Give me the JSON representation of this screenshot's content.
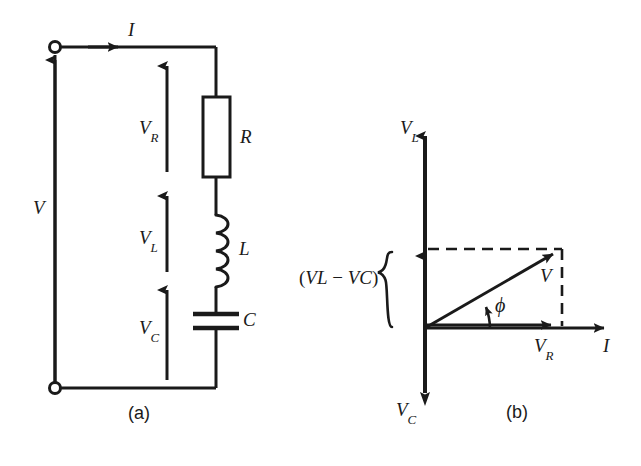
{
  "figure": {
    "title_parts": [
      "(a)",
      "(b)"
    ],
    "panel_a": {
      "caption": "(a)",
      "source_label": "V",
      "current_label": "I",
      "components": [
        {
          "name": "resistor",
          "label": "R"
        },
        {
          "name": "inductor",
          "label": "L"
        },
        {
          "name": "capacitor",
          "label": "C"
        }
      ],
      "voltage_arrows": [
        {
          "name": "v-r",
          "base": "V",
          "sub": "R"
        },
        {
          "name": "v-l",
          "base": "V",
          "sub": "L"
        },
        {
          "name": "v-c",
          "base": "V",
          "sub": "C"
        }
      ]
    },
    "panel_b": {
      "caption": "(b)",
      "axis_up_base": "V",
      "axis_up_sub": "L",
      "axis_down_base": "V",
      "axis_down_sub": "C",
      "axis_right_label": "I",
      "resultant_label": "V",
      "horizontal_phasor_base": "V",
      "horizontal_phasor_sub": "R",
      "angle_label": "ϕ",
      "brace_label_open": "(",
      "brace_label_a_base": "V",
      "brace_label_a_sub": "L",
      "brace_label_minus": "−",
      "brace_label_b_base": "V",
      "brace_label_b_sub": "C",
      "brace_label_close": ")",
      "brace_glyph": "{"
    }
  },
  "colors": {
    "ink": "#1a1a1a",
    "background": "#ffffff"
  }
}
